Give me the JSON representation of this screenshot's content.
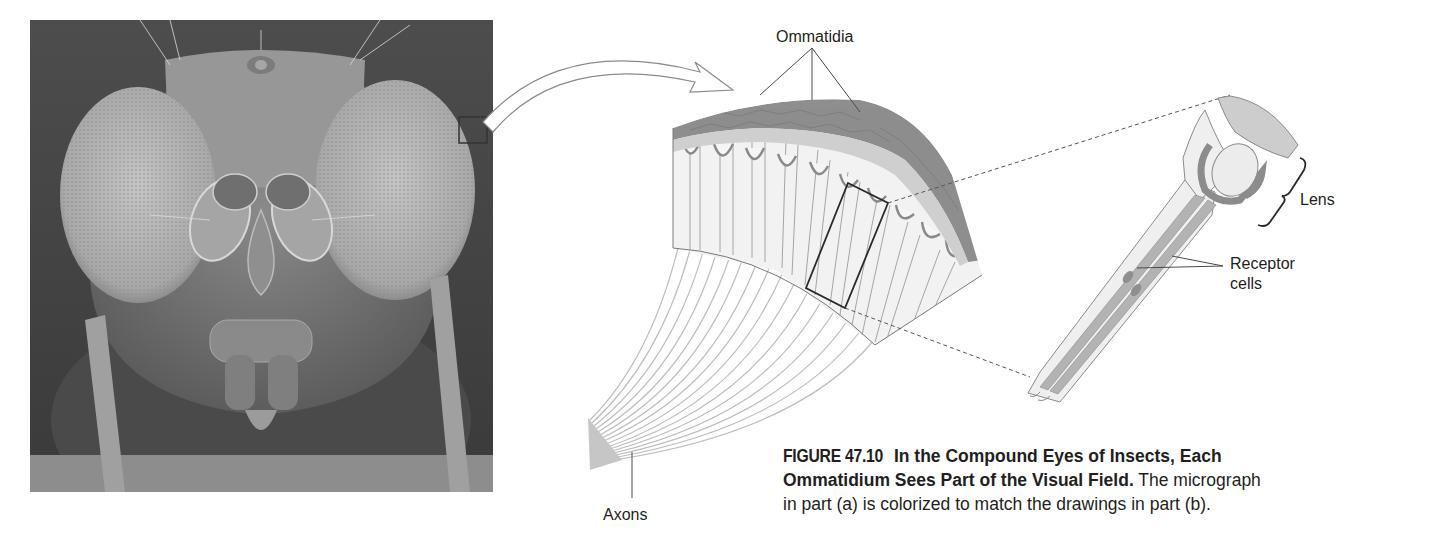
{
  "figure": {
    "number": "FIGURE 47.10",
    "title": "In the Compound Eyes of Insects, Each Ommatidium Sees Part of the Visual Field.",
    "body": "The micrograph in part (a) is colorized to match the drawings in part (b).",
    "caption_lines": [
      {
        "bold_prefix": "FIGURE 47.10",
        "bold": "In the Compound Eyes of Insects, Each",
        "normal": ""
      },
      {
        "bold_prefix": "",
        "bold": "Ommatidium Sees Part of the Visual Field.",
        "normal": " The micrograph"
      },
      {
        "bold_prefix": "",
        "bold": "",
        "normal": "in part (a) is colorized to match the drawings in part (b)."
      }
    ]
  },
  "panels": {
    "micrograph": {
      "subject": "fly-head-sem",
      "marker": "highlight-square"
    },
    "ommatidia_diagram": {
      "labels": {
        "ommatidia": "Ommatidia",
        "axons": "Axons"
      }
    },
    "ommatidium_detail": {
      "labels": {
        "lens": "Lens",
        "receptor_cells_line1": "Receptor",
        "receptor_cells_line2": "cells"
      }
    }
  },
  "colors": {
    "text": "#231f20",
    "cornea_dark": "#8c8c8c",
    "cornea_light": "#c9c9c9",
    "pigment": "#9a9a9a",
    "crystalline": "#ececec",
    "rhabdom": "#b5b5b5",
    "axon": "#bdbdbd",
    "outline": "#6e6e6e",
    "micrograph_bg": "#5a5a5a"
  }
}
